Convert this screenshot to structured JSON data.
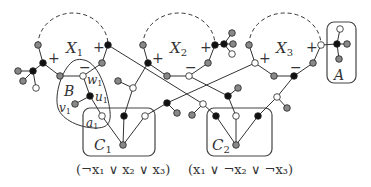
{
  "colors": {
    "stroke": "#333333",
    "black_node": "#111111",
    "gray_node": "#888888",
    "white_node": "#ffffff",
    "dashed": "#333333"
  },
  "variable_gadgets": [
    {
      "label": "X",
      "sub": "1",
      "plus_left": "+",
      "plus_right": "+",
      "minus": "−"
    },
    {
      "label": "X",
      "sub": "2",
      "plus_left": "+",
      "plus_right": "+",
      "minus": "−"
    },
    {
      "label": "X",
      "sub": "3",
      "plus_left": "+",
      "plus_right": "+",
      "minus": "−"
    }
  ],
  "clause_gadgets": [
    {
      "label": "C",
      "sub": "1",
      "formula": "(¬x₁ ∨ x₂ ∨ x₃)"
    },
    {
      "label": "C",
      "sub": "2",
      "formula": "(x₁ ∨ ¬x₂ ∨ ¬x₃)"
    }
  ],
  "special_boxes": {
    "A": {
      "label": "A"
    },
    "B": {
      "label": "B",
      "w": "w",
      "w_sub": "1",
      "u": "u",
      "u_sub": "1",
      "v": "v",
      "v_sub": "1",
      "a": "a",
      "a_sub": "1"
    }
  }
}
